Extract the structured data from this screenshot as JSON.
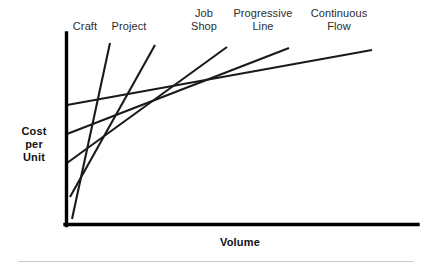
{
  "chart_data": {
    "type": "line",
    "title": "",
    "xlabel": "Volume",
    "ylabel": "Cost\nper\nUnit",
    "grid": false,
    "legend_position": "inline-top-labels",
    "axes": {
      "x_axis_label": "Volume",
      "y_axis_label": "Cost per Unit",
      "x_ticks": [],
      "y_ticks": [],
      "xlim_described": "low volume to high volume",
      "ylim_described": "low cost per unit to high cost per unit"
    },
    "annotation": "Each straight line is the cost-per-unit curve of one process type; their lower envelope forms the classic decreasing cost-versus-volume curve.",
    "series": [
      {
        "name": "Craft",
        "label": "Craft",
        "slope_description": "steepest, rises fastest with volume",
        "start": {
          "x": 72,
          "y": 219
        },
        "end": {
          "x": 110,
          "y": 43
        },
        "label_position": {
          "x": 85,
          "y": 23
        }
      },
      {
        "name": "Project",
        "label": "Project",
        "slope_description": "very steep, second fastest rise",
        "start": {
          "x": 70,
          "y": 197
        },
        "end": {
          "x": 155,
          "y": 45
        },
        "label_position": {
          "x": 125,
          "y": 23
        }
      },
      {
        "name": "Job Shop",
        "label": "Job\nShop",
        "slope_description": "moderate rise from low intercept",
        "start": {
          "x": 67,
          "y": 163
        },
        "end": {
          "x": 227,
          "y": 47
        },
        "label_position": {
          "x": 203,
          "y": 10
        }
      },
      {
        "name": "Progressive Line",
        "label": "Progressive\nLine",
        "slope_description": "shallow rise from mid intercept",
        "start": {
          "x": 67,
          "y": 134
        },
        "end": {
          "x": 289,
          "y": 48
        },
        "label_position": {
          "x": 252,
          "y": 10
        }
      },
      {
        "name": "Continuous Flow",
        "label": "Continuous\nFlow",
        "slope_description": "flattest, highest intercept, lowest marginal cost",
        "start": {
          "x": 67,
          "y": 105
        },
        "end": {
          "x": 372,
          "y": 50
        },
        "label_position": {
          "x": 330,
          "y": 10
        }
      }
    ],
    "colors": {
      "line": "#1a1a1a",
      "axis": "#000000",
      "label_text": "#2b2b2b",
      "axis_title_text": "#111111",
      "separator": "#c9c9c9",
      "background": "#ffffff"
    }
  },
  "labels": {
    "craft": "Craft",
    "project": "Project",
    "job_shop": "Job\nShop",
    "progressive_line": "Progressive\nLine",
    "continuous_flow": "Continuous\nFlow",
    "y_axis": "Cost\nper\nUnit",
    "x_axis": "Volume"
  }
}
